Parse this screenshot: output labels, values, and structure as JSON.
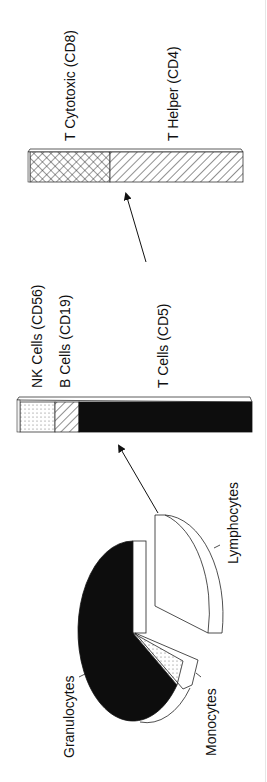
{
  "figure": {
    "orientation": "rotated-90-ccw",
    "colors": {
      "ink": "#111111",
      "fill_dark": "#0d0d0d",
      "fill_light": "#ffffff"
    }
  },
  "pie": {
    "title": "Leukocytes",
    "slices": [
      {
        "label": "Granulocytes",
        "percent": 62,
        "pattern": "solid-black"
      },
      {
        "label": "Monocytes",
        "percent": 6,
        "pattern": "dotted"
      },
      {
        "label": "Lymphocytes",
        "percent": 32,
        "pattern": "white",
        "exploded": true
      }
    ]
  },
  "lymphocyte_bar": {
    "segments": [
      {
        "label": "NK Cells (CD56)",
        "percent": 15,
        "pattern": "dotted"
      },
      {
        "label": "B Cells (CD19)",
        "percent": 10,
        "pattern": "diagonal-hatch"
      },
      {
        "label": "T Cells (CD5)",
        "percent": 75,
        "pattern": "solid-black"
      }
    ]
  },
  "t_cell_bar": {
    "segments": [
      {
        "label": "T Cytotoxic (CD8)",
        "percent": 37,
        "pattern": "cross-hatch"
      },
      {
        "label": "T Helper (CD4)",
        "percent": 63,
        "pattern": "diagonal-hatch"
      }
    ]
  },
  "labels": {
    "granulocytes": "Granulocytes",
    "monocytes": "Monocytes",
    "lymphocytes": "Lymphocytes",
    "nk": "NK Cells (CD56)",
    "b": "B Cells (CD19)",
    "t": "T Cells (CD5)",
    "cd8": "T Cytotoxic (CD8)",
    "cd4": "T Helper (CD4)"
  },
  "arrows": [
    {
      "from": "Lymphocytes slice",
      "to": "lymphocyte bar"
    },
    {
      "from": "T Cells segment",
      "to": "T cell bar"
    }
  ]
}
